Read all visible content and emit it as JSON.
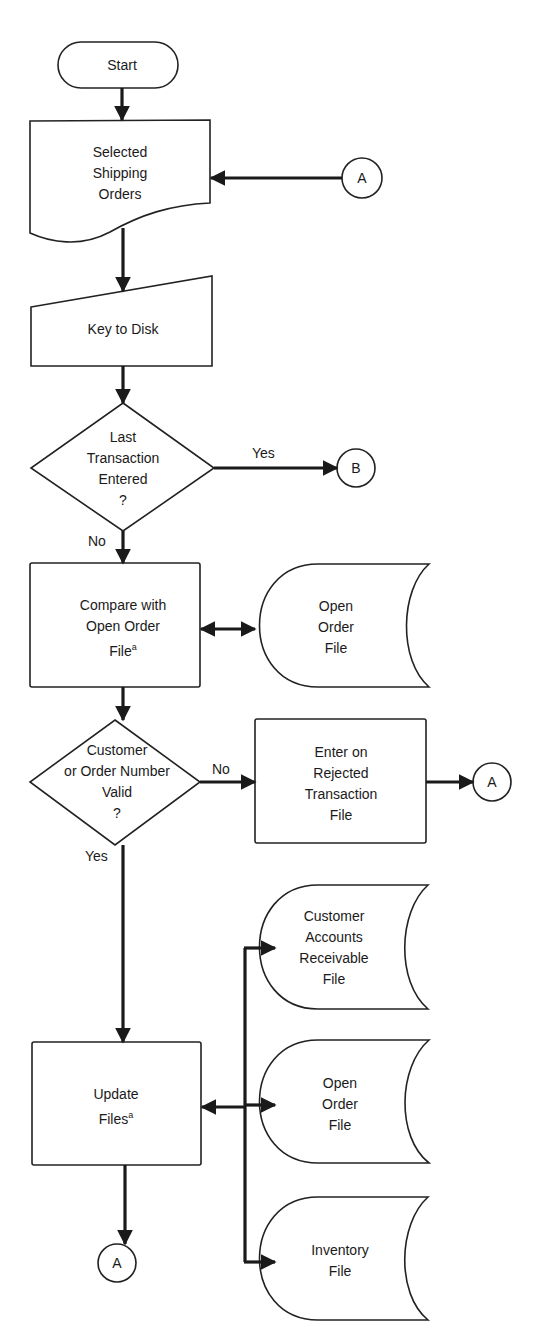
{
  "diagram": {
    "type": "flowchart",
    "nodes": {
      "start": {
        "shape": "terminal",
        "label": "Start"
      },
      "shipping_orders": {
        "shape": "document",
        "lines": [
          "Selected",
          "Shipping",
          "Orders"
        ]
      },
      "key_to_disk": {
        "shape": "manual-input",
        "label": "Key to Disk"
      },
      "last_transaction": {
        "shape": "decision",
        "lines": [
          "Last",
          "Transaction",
          "Entered",
          "?"
        ]
      },
      "compare": {
        "shape": "process",
        "lines": [
          "Compare with",
          "Open Order",
          "File"
        ],
        "footnote": "a"
      },
      "open_order_file_1": {
        "shape": "storage",
        "lines": [
          "Open",
          "Order",
          "File"
        ]
      },
      "valid_check": {
        "shape": "decision",
        "lines": [
          "Customer",
          "or Order Number",
          "Valid",
          "?"
        ]
      },
      "rejected": {
        "shape": "process",
        "lines": [
          "Enter on",
          "Rejected",
          "Transaction",
          "File"
        ]
      },
      "customer_ar_file": {
        "shape": "storage",
        "lines": [
          "Customer",
          "Accounts",
          "Receivable",
          "File"
        ]
      },
      "update_files": {
        "shape": "process",
        "lines": [
          "Update",
          "Files"
        ],
        "footnote": "a"
      },
      "open_order_file_2": {
        "shape": "storage",
        "lines": [
          "Open",
          "Order",
          "File"
        ]
      },
      "inventory_file": {
        "shape": "storage",
        "lines": [
          "Inventory",
          "File"
        ]
      },
      "connector_a_top": {
        "shape": "connector",
        "label": "A"
      },
      "connector_b": {
        "shape": "connector",
        "label": "B"
      },
      "connector_a_right": {
        "shape": "connector",
        "label": "A"
      },
      "connector_a_bottom": {
        "shape": "connector",
        "label": "A"
      }
    },
    "edge_labels": {
      "last_yes": "Yes",
      "last_no": "No",
      "valid_no": "No",
      "valid_yes": "Yes"
    },
    "edges": [
      {
        "from": "start",
        "to": "shipping_orders"
      },
      {
        "from": "connector_a_top",
        "to": "shipping_orders"
      },
      {
        "from": "shipping_orders",
        "to": "key_to_disk"
      },
      {
        "from": "key_to_disk",
        "to": "last_transaction"
      },
      {
        "from": "last_transaction",
        "to": "connector_b",
        "label": "Yes"
      },
      {
        "from": "last_transaction",
        "to": "compare",
        "label": "No"
      },
      {
        "from": "compare",
        "to": "open_order_file_1",
        "bidirectional": true
      },
      {
        "from": "compare",
        "to": "valid_check"
      },
      {
        "from": "valid_check",
        "to": "rejected",
        "label": "No"
      },
      {
        "from": "rejected",
        "to": "connector_a_right"
      },
      {
        "from": "valid_check",
        "to": "update_files",
        "label": "Yes"
      },
      {
        "from": "update_files",
        "to": "customer_ar_file",
        "bidirectional": true
      },
      {
        "from": "update_files",
        "to": "open_order_file_2",
        "bidirectional": true
      },
      {
        "from": "update_files",
        "to": "inventory_file",
        "bidirectional": true
      },
      {
        "from": "update_files",
        "to": "connector_a_bottom"
      }
    ]
  }
}
